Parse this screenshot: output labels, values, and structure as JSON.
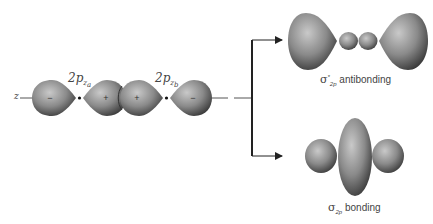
{
  "axis": {
    "label": "z"
  },
  "atomic_orbitals": [
    {
      "name": "2p",
      "subscript": "z",
      "atom": "a"
    },
    {
      "name": "2p",
      "subscript": "z",
      "atom": "b"
    }
  ],
  "lobe_signs": [
    "−",
    "+",
    "+",
    "−"
  ],
  "molecular_orbitals": {
    "antibonding": {
      "symbol": "σ",
      "superscript": "*",
      "subscript": "2p",
      "text": "antibonding"
    },
    "bonding": {
      "symbol": "σ",
      "subscript": "2p",
      "text": "bonding"
    }
  },
  "colors": {
    "lobe_dark": "#3c3c3c",
    "lobe_light": "#bdbdbd",
    "line": "#2a2a2a"
  }
}
